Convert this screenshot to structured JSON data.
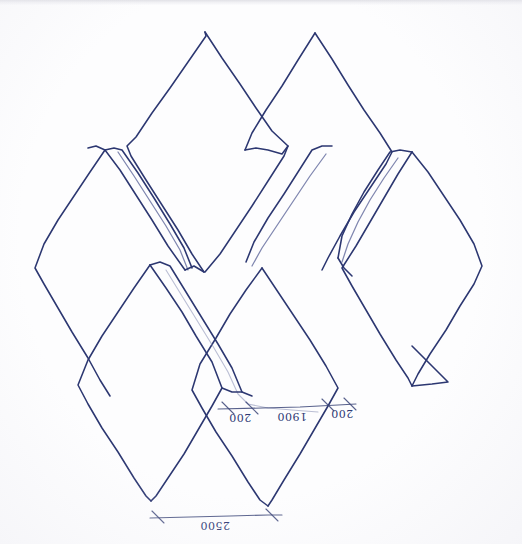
{
  "document": {
    "title": "Hand-drawn diamond tessellation sketch",
    "medium": "blue ballpoint pen on white paper",
    "ink_color": "#2c3771",
    "paper_color": "#fdfdfe",
    "orientation_note": "annotations appear mirrored / upside-down in the scan"
  },
  "annotations": {
    "dimension_left": "200",
    "dimension_center": "1900",
    "dimension_right": "200",
    "dimension_bottom": "2500"
  },
  "labels": {
    "left_label_display": "200",
    "center_label_display": "1900",
    "right_label_display": "200",
    "bottom_label_display": "2500"
  },
  "geometry": {
    "description": "Interlocking rhombus / diamond tessellation forming a folded-sheet crease pattern",
    "diamonds": [
      {
        "name": "top-left-diamond",
        "top": [
          205,
          32
        ],
        "left": [
          127,
          145
        ],
        "bottom": [
          205,
          272
        ],
        "right": [
          288,
          145
        ]
      },
      {
        "name": "top-right-diamond",
        "top": [
          315,
          33
        ],
        "left": [
          245,
          150
        ],
        "bottom": [
          322,
          270
        ],
        "right": [
          392,
          152
        ]
      },
      {
        "name": "mid-left-diamond",
        "top": [
          105,
          150
        ],
        "left": [
          35,
          268
        ],
        "bottom": [
          110,
          395
        ],
        "right": [
          185,
          270
        ]
      },
      {
        "name": "mid-right-diamond",
        "top": [
          412,
          152
        ],
        "left": [
          342,
          268
        ],
        "bottom": [
          412,
          385
        ],
        "right": [
          482,
          265
        ]
      },
      {
        "name": "bottom-left-diamond",
        "top": [
          150,
          265
        ],
        "left": [
          78,
          385
        ],
        "bottom": [
          150,
          500
        ],
        "right": [
          222,
          388
        ]
      },
      {
        "name": "bottom-center-diamond",
        "top": [
          262,
          268
        ],
        "left": [
          192,
          390
        ],
        "bottom": [
          268,
          505
        ],
        "right": [
          338,
          388
        ]
      }
    ],
    "flaps": [
      {
        "name": "left-flap-strip",
        "points": "105,150 118,148 192,268 180,272"
      },
      {
        "name": "center-flap-strip",
        "points": "318,148 330,146 252,268 240,270"
      },
      {
        "name": "right-flap-strip",
        "points": "398,150 412,152 348,262 336,262"
      },
      {
        "name": "lower-flap-strip",
        "points": "152,265 165,263 240,392 228,396"
      },
      {
        "name": "corner-flap-triangle",
        "points": "412,385 448,382 412,360"
      }
    ]
  }
}
